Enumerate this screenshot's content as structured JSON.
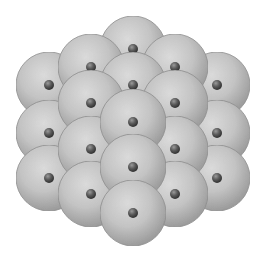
{
  "diagram": {
    "width": 267,
    "height": 261,
    "background": "#ffffff",
    "atom_radius": 33,
    "nucleus_radius": 5,
    "colors": {
      "atom_highlight": "#dcdcdc",
      "atom_mid": "#c4c4c4",
      "atom_edge": "#9a9a9a",
      "atom_outline": "#8c8c8c",
      "nucleus_highlight": "#9a9a9a",
      "nucleus_mid": "#5a5a5a",
      "nucleus_edge": "#2e2e2e"
    },
    "atoms": [
      {
        "id": "a1",
        "x": 133,
        "y": 49,
        "layer": 0
      },
      {
        "id": "a2",
        "x": 49,
        "y": 85,
        "layer": 1
      },
      {
        "id": "a3",
        "x": 217,
        "y": 85,
        "layer": 1
      },
      {
        "id": "a4",
        "x": 91,
        "y": 67,
        "layer": 2
      },
      {
        "id": "a5",
        "x": 175,
        "y": 67,
        "layer": 2
      },
      {
        "id": "a6",
        "x": 133,
        "y": 85,
        "layer": 3
      },
      {
        "id": "a7",
        "x": 49,
        "y": 133,
        "layer": 4
      },
      {
        "id": "a8",
        "x": 217,
        "y": 133,
        "layer": 4
      },
      {
        "id": "a9",
        "x": 91,
        "y": 103,
        "layer": 5
      },
      {
        "id": "a10",
        "x": 175,
        "y": 103,
        "layer": 5
      },
      {
        "id": "a11",
        "x": 49,
        "y": 178,
        "layer": 6
      },
      {
        "id": "a12",
        "x": 217,
        "y": 178,
        "layer": 6
      },
      {
        "id": "a13",
        "x": 91,
        "y": 149,
        "layer": 7
      },
      {
        "id": "a14",
        "x": 175,
        "y": 149,
        "layer": 7
      },
      {
        "id": "a15",
        "x": 133,
        "y": 122,
        "layer": 8
      },
      {
        "id": "a16",
        "x": 91,
        "y": 194,
        "layer": 9
      },
      {
        "id": "a17",
        "x": 175,
        "y": 194,
        "layer": 9
      },
      {
        "id": "a18",
        "x": 133,
        "y": 167,
        "layer": 10
      },
      {
        "id": "a19",
        "x": 133,
        "y": 213,
        "layer": 11
      }
    ]
  }
}
